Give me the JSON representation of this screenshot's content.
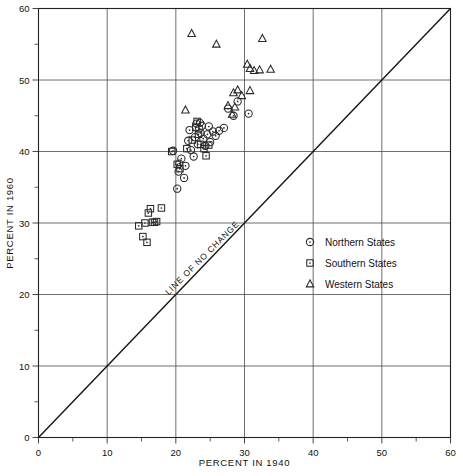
{
  "chart_data": {
    "type": "scatter",
    "title": "",
    "xlabel": "PERCENT IN 1940",
    "ylabel": "PERCENT IN 1960",
    "xlim": [
      0,
      60
    ],
    "ylim": [
      0,
      60
    ],
    "xticks": [
      0,
      10,
      20,
      30,
      40,
      50,
      60
    ],
    "yticks": [
      0,
      10,
      20,
      30,
      40,
      50,
      60
    ],
    "xtick_labels": [
      "0",
      "10",
      "20",
      "30",
      "40",
      "50",
      "60"
    ],
    "ytick_labels": [
      "0",
      "10",
      "20",
      "30",
      "40",
      "50",
      "60"
    ],
    "minor_tick_step": 5,
    "grid": "major-only",
    "legend_position": "center-right",
    "annotations": [
      {
        "text": "LINE OF NO CHANGE",
        "x": 24.5,
        "y": 24.5,
        "rotation": -45,
        "name": "line-of-no-change-label"
      }
    ],
    "reference_line": {
      "name": "line-of-no-change",
      "from": [
        0,
        0
      ],
      "to": [
        60,
        60
      ],
      "label": "LINE OF NO CHANGE"
    },
    "legend": [
      {
        "label": "Northern States",
        "marker": "circle"
      },
      {
        "label": "Southern States",
        "marker": "square"
      },
      {
        "label": "Western States",
        "marker": "triangle"
      }
    ],
    "series": [
      {
        "name": "Northern States",
        "marker": "circle",
        "points": [
          [
            20.2,
            34.8
          ],
          [
            20.4,
            37.2
          ],
          [
            20.5,
            38.3
          ],
          [
            20.8,
            39.0
          ],
          [
            21.2,
            36.3
          ],
          [
            21.4,
            38.0
          ],
          [
            21.8,
            41.5
          ],
          [
            22.2,
            40.2
          ],
          [
            22.6,
            39.3
          ],
          [
            22.8,
            42.0
          ],
          [
            23.2,
            41.0
          ],
          [
            23.4,
            43.2
          ],
          [
            23.5,
            44.0
          ],
          [
            23.6,
            42.6
          ],
          [
            23.8,
            43.6
          ],
          [
            24.0,
            41.8
          ],
          [
            24.3,
            40.8
          ],
          [
            24.6,
            42.4
          ],
          [
            25.0,
            41.3
          ],
          [
            25.4,
            42.8
          ],
          [
            25.8,
            42.2
          ],
          [
            26.3,
            42.9
          ],
          [
            27.0,
            43.3
          ],
          [
            27.6,
            46.0
          ],
          [
            28.4,
            45.0
          ],
          [
            29.0,
            47.0
          ],
          [
            30.6,
            45.3
          ],
          [
            19.6,
            40.1
          ],
          [
            22.0,
            43.0
          ],
          [
            23.0,
            43.9
          ],
          [
            24.8,
            43.5
          ]
        ]
      },
      {
        "name": "Southern States",
        "marker": "square",
        "points": [
          [
            14.6,
            29.6
          ],
          [
            15.2,
            28.1
          ],
          [
            15.5,
            30.0
          ],
          [
            15.8,
            27.3
          ],
          [
            16.0,
            31.4
          ],
          [
            16.3,
            32.0
          ],
          [
            16.6,
            30.1
          ],
          [
            16.9,
            30.1
          ],
          [
            17.2,
            30.2
          ],
          [
            17.9,
            32.1
          ],
          [
            19.4,
            40.0
          ],
          [
            20.2,
            38.2
          ],
          [
            20.6,
            37.6
          ],
          [
            22.9,
            43.4
          ],
          [
            23.1,
            44.2
          ],
          [
            23.3,
            42.4
          ],
          [
            23.6,
            41.0
          ],
          [
            24.1,
            40.4
          ],
          [
            24.4,
            39.4
          ],
          [
            24.8,
            40.9
          ],
          [
            21.6,
            40.4
          ],
          [
            22.4,
            41.6
          ]
        ]
      },
      {
        "name": "Western States",
        "marker": "triangle",
        "points": [
          [
            22.3,
            56.5
          ],
          [
            25.9,
            55.0
          ],
          [
            30.4,
            52.2
          ],
          [
            30.8,
            51.6
          ],
          [
            31.4,
            51.3
          ],
          [
            32.2,
            51.4
          ],
          [
            32.6,
            55.8
          ],
          [
            33.8,
            51.5
          ],
          [
            28.4,
            48.2
          ],
          [
            29.0,
            48.6
          ],
          [
            29.6,
            47.8
          ],
          [
            30.8,
            48.5
          ],
          [
            27.6,
            46.4
          ],
          [
            28.6,
            46.2
          ],
          [
            21.4,
            45.8
          ],
          [
            28.2,
            45.2
          ]
        ]
      }
    ]
  },
  "legend_items": {
    "northern": "Northern States",
    "southern": "Southern States",
    "western": "Western States"
  },
  "axes": {
    "x_title": "PERCENT IN 1940",
    "y_title": "PERCENT IN 1960"
  },
  "ticks": {
    "x": [
      "0",
      "10",
      "20",
      "30",
      "40",
      "50",
      "60"
    ],
    "y": [
      "0",
      "10",
      "20",
      "30",
      "40",
      "50",
      "60"
    ]
  },
  "line_label": "LINE OF NO CHANGE"
}
